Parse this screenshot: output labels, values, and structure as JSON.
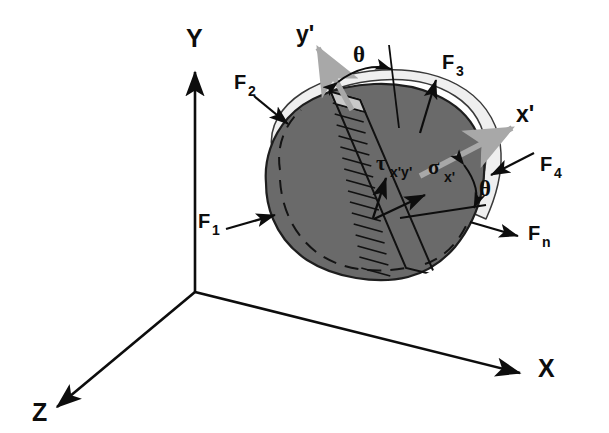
{
  "figure": {
    "background_color": "#ffffff",
    "width": 609,
    "height": 433
  },
  "colors": {
    "ink": "#0d0d0d",
    "body_fill": "#6a6a6a",
    "rim_fill": "#efefef",
    "rim_shadow": "#9a9a9a",
    "prime_axis_gray": "#a8a8a8",
    "background": "#ffffff"
  },
  "global_axes": {
    "name": "cartesian-triad",
    "origin": {
      "x": 195,
      "y": 292
    },
    "items": [
      {
        "id": "y-axis",
        "label": "Y",
        "label_x": 196,
        "label_y": 47,
        "direction": "up"
      },
      {
        "id": "x-axis",
        "label": "X",
        "label_x": 545,
        "label_y": 375,
        "direction": "down-right"
      },
      {
        "id": "z-axis",
        "label": "Z",
        "label_x": 38,
        "label_y": 420,
        "direction": "down-left"
      }
    ]
  },
  "prime_axes": {
    "name": "rotated-axes",
    "items": [
      {
        "id": "y-prime",
        "label": "y'",
        "label_x": 296,
        "label_y": 42
      },
      {
        "id": "x-prime",
        "label": "x'",
        "label_x": 516,
        "label_y": 122
      }
    ]
  },
  "angles": [
    {
      "id": "theta-upper",
      "label": "θ",
      "label_x": 353,
      "label_y": 62
    },
    {
      "id": "theta-lower",
      "label": "θ",
      "label_x": 479,
      "label_y": 196
    }
  ],
  "stresses": [
    {
      "id": "shear-stress",
      "symbol": "τ",
      "subscript": "x'y'",
      "symbol_x": 383,
      "symbol_y": 163,
      "sub_x": 396,
      "sub_y": 170
    },
    {
      "id": "normal-stress",
      "symbol": "σ",
      "subscript": "x'",
      "symbol_x": 432,
      "symbol_y": 168,
      "sub_x": 448,
      "sub_y": 176
    }
  ],
  "forces": [
    {
      "id": "force-1",
      "label": "F",
      "subscript": "1",
      "label_x": 198,
      "label_y": 228,
      "sub_x": 213,
      "sub_y": 235
    },
    {
      "id": "force-2",
      "label": "F",
      "subscript": "2",
      "label_x": 234,
      "label_y": 89,
      "sub_x": 249,
      "sub_y": 96
    },
    {
      "id": "force-3",
      "label": "F",
      "subscript": "3",
      "label_x": 442,
      "label_y": 69,
      "sub_x": 457,
      "sub_y": 76
    },
    {
      "id": "force-4",
      "label": "F",
      "subscript": "4",
      "label_x": 540,
      "label_y": 171,
      "sub_x": 555,
      "sub_y": 178
    },
    {
      "id": "force-n",
      "label": "F",
      "subscript": "n",
      "label_x": 528,
      "label_y": 240,
      "sub_x": 543,
      "sub_y": 247
    }
  ],
  "body": {
    "name": "arbitrary-rigid-body",
    "description": "Irregular blob shaded dark gray with a light 3D rim along the upper-right edge and dashed interior contour lines"
  },
  "section_band": {
    "name": "hatched-cut-plane",
    "description": "Ladder-hatched inclined strip crossing the body from upper-left to lower-right, representing the cut plane",
    "rung_count": 16
  }
}
